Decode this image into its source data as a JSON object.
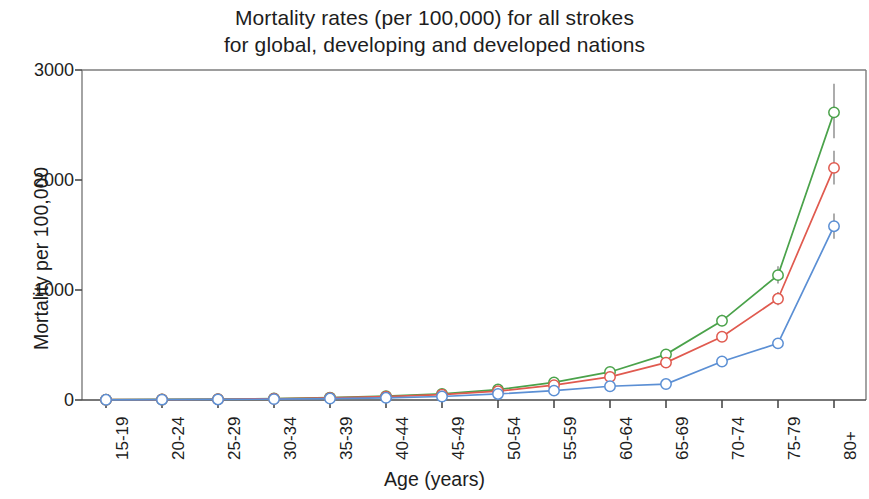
{
  "chart_data": {
    "type": "line",
    "title": "Mortality rates (per 100,000) for all strokes for global, developing and developed nations",
    "title_line1": "Mortality rates (per 100,000) for all strokes",
    "title_line2": "for global, developing and developed nations",
    "xlabel": "Age (years)",
    "ylabel": "Mortality per 100,000",
    "categories": [
      "15-19",
      "20-24",
      "25-29",
      "30-34",
      "35-39",
      "40-44",
      "45-49",
      "50-54",
      "55-59",
      "60-64",
      "65-69",
      "70-74",
      "75-79",
      "80+"
    ],
    "ylim": [
      0,
      3000
    ],
    "yticks": [
      0,
      1000,
      2000,
      3000
    ],
    "ytick_labels": [
      "0",
      "1000",
      "2000",
      "3000"
    ],
    "grid": false,
    "legend": "none",
    "error_bars": true,
    "series": [
      {
        "name": "developing",
        "color": "#4aa24a",
        "values": [
          3,
          5,
          8,
          13,
          22,
          35,
          55,
          95,
          160,
          255,
          415,
          720,
          1135,
          2615
        ],
        "err_low": [
          3,
          5,
          8,
          13,
          20,
          32,
          50,
          88,
          150,
          240,
          390,
          670,
          1060,
          2380
        ],
        "err_high": [
          3,
          5,
          8,
          13,
          24,
          38,
          60,
          102,
          172,
          272,
          445,
          775,
          1215,
          2875
        ]
      },
      {
        "name": "global",
        "color": "#e05a4f",
        "values": [
          3,
          4,
          7,
          11,
          19,
          30,
          48,
          80,
          135,
          210,
          340,
          575,
          920,
          2110
        ],
        "err_low": [
          3,
          4,
          7,
          11,
          17,
          27,
          43,
          74,
          126,
          197,
          318,
          538,
          862,
          1960
        ],
        "err_high": [
          3,
          4,
          7,
          11,
          21,
          33,
          53,
          86,
          145,
          224,
          363,
          613,
          982,
          2265
        ]
      },
      {
        "name": "developed",
        "color": "#5b8fd4",
        "values": [
          2,
          3,
          5,
          8,
          13,
          20,
          32,
          55,
          85,
          125,
          145,
          350,
          515,
          1580
        ],
        "err_low": [
          2,
          3,
          5,
          8,
          12,
          18,
          29,
          50,
          78,
          115,
          133,
          322,
          476,
          1465
        ],
        "err_high": [
          2,
          3,
          5,
          8,
          14,
          22,
          35,
          60,
          92,
          135,
          157,
          378,
          554,
          1695
        ]
      }
    ]
  },
  "axes": {
    "frame_color": "#7d7d7d",
    "marker_shape": "open-circle"
  }
}
